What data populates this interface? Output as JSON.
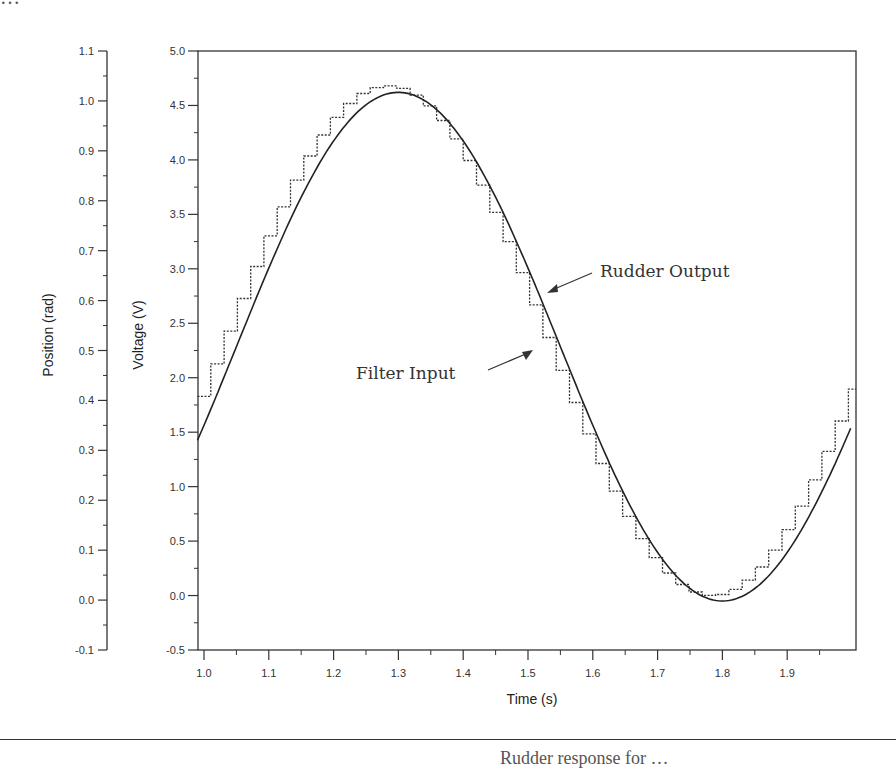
{
  "page": {
    "top_fragment": "…",
    "caption_fragment": "Rudder response for …"
  },
  "chart_data": {
    "type": "line",
    "title": "",
    "xlabel": "Time (s)",
    "ylabel": "Voltage (V)",
    "ylabel_secondary": "Position (rad)",
    "xlim": [
      0.99,
      2.0
    ],
    "ylim": [
      -0.5,
      5.0
    ],
    "ylim_secondary": [
      -0.1,
      1.1
    ],
    "x_ticks": [
      "1.0",
      "1.1",
      "1.2",
      "1.3",
      "1.4",
      "1.5",
      "1.6",
      "1.7",
      "1.8",
      "1.9"
    ],
    "y_ticks": [
      "-0.5",
      "0.0",
      "0.5",
      "1.0",
      "1.5",
      "2.0",
      "2.5",
      "3.0",
      "3.5",
      "4.0",
      "4.5",
      "5.0"
    ],
    "y_ticks_secondary": [
      "-0.1",
      "0.0",
      "0.1",
      "0.2",
      "0.3",
      "0.4",
      "0.5",
      "0.6",
      "0.7",
      "0.8",
      "0.9",
      "1.0",
      "1.1"
    ],
    "grid": false,
    "legend": null,
    "annotations": [
      {
        "text": "Rudder Output",
        "target_x": 1.53,
        "target_y": 2.7
      },
      {
        "text": "Filter Input",
        "target_x": 1.51,
        "target_y": 2.3
      }
    ],
    "series": [
      {
        "name": "Rudder Output",
        "style": "solid",
        "description": "Smooth sinusoid, period ~1.0 s",
        "x": [
          0.99,
          1.05,
          1.1,
          1.15,
          1.2,
          1.25,
          1.3,
          1.35,
          1.4,
          1.45,
          1.5,
          1.55,
          1.6,
          1.65,
          1.7,
          1.75,
          1.8,
          1.85,
          1.9,
          1.95,
          2.0
        ],
        "values": [
          1.45,
          2.05,
          2.65,
          3.25,
          3.85,
          4.35,
          4.62,
          4.45,
          4.05,
          3.45,
          2.85,
          2.25,
          1.55,
          0.95,
          0.45,
          0.05,
          -0.05,
          0.15,
          0.55,
          1.05,
          1.6
        ]
      },
      {
        "name": "Filter Input",
        "style": "dotted staircase",
        "description": "Sampled (zero-order hold) sinusoid leading the rudder output, step ~0.02 s",
        "x": [
          0.99,
          1.05,
          1.1,
          1.15,
          1.2,
          1.25,
          1.27,
          1.3,
          1.35,
          1.4,
          1.45,
          1.5,
          1.55,
          1.6,
          1.65,
          1.7,
          1.75,
          1.78,
          1.8,
          1.85,
          1.9,
          1.95,
          2.0
        ],
        "values": [
          1.85,
          2.85,
          3.55,
          4.05,
          4.45,
          4.65,
          4.68,
          4.6,
          4.2,
          3.65,
          2.95,
          2.25,
          1.55,
          0.95,
          0.45,
          0.1,
          0.0,
          0.0,
          0.05,
          0.35,
          0.95,
          1.55,
          2.1
        ]
      }
    ]
  }
}
